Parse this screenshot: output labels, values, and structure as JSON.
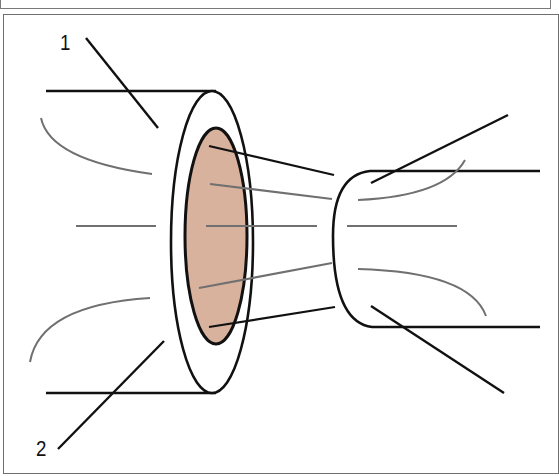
{
  "diagram": {
    "labels": [
      {
        "id": "1",
        "text": "1"
      },
      {
        "id": "2",
        "text": "2"
      }
    ],
    "colors": {
      "outline": "#111111",
      "flow_lines": "#6e6e6e",
      "lumen_fill": "#D9B29E",
      "frame": "#6f6f6f"
    }
  }
}
